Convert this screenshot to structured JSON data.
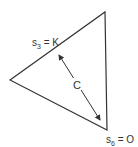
{
  "diagram": {
    "shape": "triangle",
    "vertices": [
      [
        10,
        80
      ],
      [
        105,
        12
      ],
      [
        107,
        130
      ]
    ],
    "stroke_color": "#333333",
    "labels": {
      "top_edge": {
        "base": "s",
        "sub": "3",
        "rest": " = K"
      },
      "bottom_vertex": {
        "base": "s",
        "sub": "6",
        "rest": " = O"
      },
      "center": "C"
    },
    "arrow": {
      "from": [
        58,
        53
      ],
      "to": [
        101,
        122
      ],
      "double_headed": true
    }
  }
}
